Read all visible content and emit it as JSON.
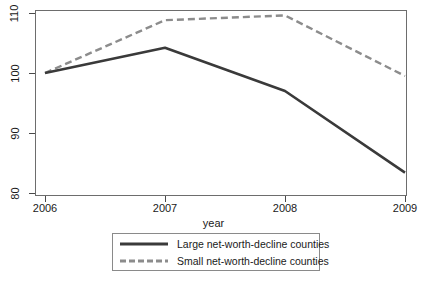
{
  "chart_data": {
    "type": "line",
    "title": "",
    "subtitle": "",
    "xlabel": "year",
    "ylabel": "",
    "x": [
      2006,
      2007,
      2008,
      2009
    ],
    "xticklabels": [
      "2006",
      "2007",
      "2008",
      "2009"
    ],
    "yticklabels": [
      "110",
      "100",
      "90",
      "80"
    ],
    "yticks": [
      110,
      100,
      90,
      80
    ],
    "xlim": [
      2006,
      2009
    ],
    "ylim": [
      78,
      111
    ],
    "grid": false,
    "legend_position": "below-plot",
    "series": [
      {
        "name": "Large net-worth-decline counties",
        "values": [
          100.0,
          104.2,
          97.0,
          83.4
        ],
        "style": "solid",
        "color": "#3a3a3a",
        "width": 2.6
      },
      {
        "name": "Small net-worth-decline counties",
        "values": [
          100.0,
          108.8,
          109.6,
          99.5
        ],
        "style": "dashed",
        "color": "#8c8c8c",
        "width": 2.4
      }
    ]
  },
  "axes": {
    "x_title": "year",
    "x_tick_labels": [
      "2006",
      "2007",
      "2008",
      "2009"
    ],
    "y_tick_labels": [
      "110",
      "100",
      "90",
      "80"
    ]
  },
  "legend": {
    "entries": [
      {
        "label": "Large net-worth-decline counties",
        "swatch": "solid-line-swatch"
      },
      {
        "label": "Small net-worth-decline counties",
        "swatch": "dashed-line-swatch"
      }
    ]
  },
  "colors": {
    "series_large": "#3a3a3a",
    "series_small": "#8c8c8c",
    "frame": "#6d6d6d",
    "legend_border": "#8a8a8a",
    "background": "#ffffff",
    "text": "#1a1a1a"
  }
}
